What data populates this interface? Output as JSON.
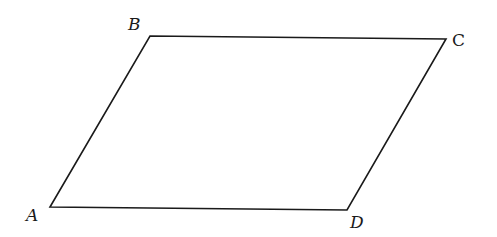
{
  "diagram": {
    "type": "parallelogram",
    "vertices": [
      {
        "name": "A",
        "x": 50,
        "y": 207,
        "label_x": 26,
        "label_y": 221
      },
      {
        "name": "B",
        "x": 150,
        "y": 36,
        "label_x": 128,
        "label_y": 30
      },
      {
        "name": "C",
        "x": 446,
        "y": 39,
        "label_x": 452,
        "label_y": 46
      },
      {
        "name": "D",
        "x": 347,
        "y": 210,
        "label_x": 350,
        "label_y": 228
      }
    ],
    "edges": [
      [
        "A",
        "B"
      ],
      [
        "B",
        "C"
      ],
      [
        "C",
        "D"
      ],
      [
        "D",
        "A"
      ]
    ],
    "stroke_color": "#1a1a1a",
    "background": "#ffffff"
  },
  "labels": {
    "A": "A",
    "B": "B",
    "C": "C",
    "D": "D"
  }
}
